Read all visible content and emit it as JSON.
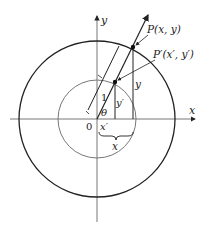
{
  "diagram": {
    "axis_labels": {
      "x": "x",
      "y": "y"
    },
    "origin_label": "0",
    "point_P": "P(x, y)",
    "point_P_prime": "P′(x′, y′)",
    "unit_length_label": "1",
    "angle_label": "θ",
    "x_prime_label": "x′",
    "y_prime_label": "y′",
    "x_label": "x",
    "y_label": "y",
    "colors": {
      "outer_circle": "#222222",
      "inner_circle": "#777777",
      "axes": "#555555",
      "ink": "#222222"
    }
  }
}
